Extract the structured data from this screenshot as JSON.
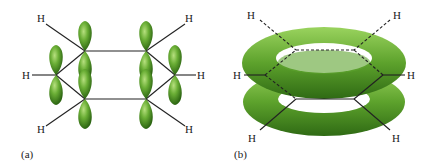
{
  "figure": {
    "panel_a": {
      "label": "(a)",
      "atom_label": "H"
    },
    "panel_b": {
      "label": "(b)",
      "atom_label": "H"
    }
  },
  "colors": {
    "lobe": "#5a9e2e",
    "lobe_light": "#9fd36a",
    "lobe_dark": "#2f6a14",
    "bond": "#222222"
  }
}
